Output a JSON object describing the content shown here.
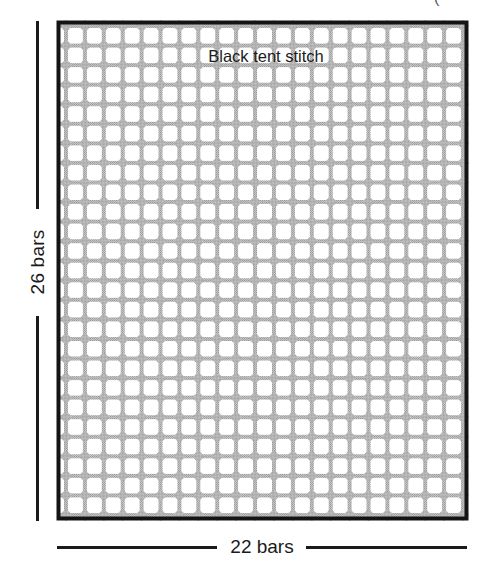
{
  "diagram": {
    "grid": {
      "columns": 22,
      "rows": 26,
      "bar_color": "#b4b4b4",
      "node_color": "#8e8e8e",
      "hole_color": "#ffffff",
      "border_color": "#141414"
    },
    "labels": {
      "inside": "Black tent stitch",
      "width_dimension": "22 bars",
      "height_dimension": "26 bars"
    },
    "fragment_glyph": "("
  }
}
